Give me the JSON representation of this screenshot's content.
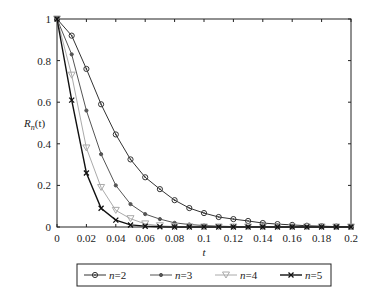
{
  "chart_data": {
    "type": "line",
    "title": "",
    "xlabel": "t",
    "ylabel_main": "R",
    "ylabel_sub": "n",
    "ylabel_suffix": "(t)",
    "xlim": [
      0,
      0.2
    ],
    "ylim": [
      0,
      1
    ],
    "grid": false,
    "x_ticks": [
      0,
      0.02,
      0.04,
      0.06,
      0.08,
      0.1,
      0.12,
      0.14,
      0.16,
      0.18,
      0.2
    ],
    "x_tick_labels": [
      "0",
      "0.02",
      "0.04",
      "0.06",
      "0.08",
      "0.1",
      "0.12",
      "0.14",
      "0.16",
      "0.18",
      "0.2"
    ],
    "y_ticks": [
      0,
      0.2,
      0.4,
      0.6,
      0.8,
      1
    ],
    "y_tick_labels": [
      "0",
      "0.2",
      "0.4",
      "0.6",
      "0.8",
      "1"
    ],
    "x": [
      0,
      0.01,
      0.02,
      0.03,
      0.04,
      0.05,
      0.06,
      0.07,
      0.08,
      0.09,
      0.1,
      0.11,
      0.12,
      0.13,
      0.14,
      0.15,
      0.16,
      0.17,
      0.18,
      0.19,
      0.2
    ],
    "legend_position": "bottom",
    "series": [
      {
        "name": "n=2",
        "var": "n",
        "val": "=2",
        "marker": "circle",
        "color": "#333333",
        "values": [
          1.0,
          0.92,
          0.76,
          0.59,
          0.445,
          0.325,
          0.239,
          0.182,
          0.129,
          0.091,
          0.067,
          0.048,
          0.038,
          0.029,
          0.019,
          0.014,
          0.01,
          0.006,
          0.004,
          0.002,
          0.001
        ]
      },
      {
        "name": "n=3",
        "var": "n",
        "val": "=3",
        "marker": "dot",
        "color": "#555555",
        "values": [
          1.0,
          0.83,
          0.56,
          0.35,
          0.2,
          0.11,
          0.062,
          0.038,
          0.02,
          0.012,
          0.007,
          0.004,
          0.002,
          0.001,
          0.001,
          0.0,
          0.0,
          0.0,
          0.0,
          0.0,
          0.0
        ]
      },
      {
        "name": "n=4",
        "var": "n",
        "val": "=4",
        "marker": "triangle-down",
        "color": "#aaaaaa",
        "values": [
          1.0,
          0.73,
          0.38,
          0.19,
          0.08,
          0.04,
          0.015,
          0.006,
          0.002,
          0.001,
          0.0,
          0.0,
          0.0,
          0.0,
          0.0,
          0.0,
          0.0,
          0.0,
          0.0,
          0.0,
          0.0
        ]
      },
      {
        "name": "n=5",
        "var": "n",
        "val": "=5",
        "marker": "x",
        "color": "#111111",
        "values": [
          1.0,
          0.61,
          0.26,
          0.09,
          0.033,
          0.01,
          0.004,
          0.001,
          0.0,
          0.0,
          0.0,
          0.0,
          0.0,
          0.0,
          0.0,
          0.0,
          0.0,
          0.0,
          0.0,
          0.0,
          0.0
        ]
      }
    ]
  }
}
